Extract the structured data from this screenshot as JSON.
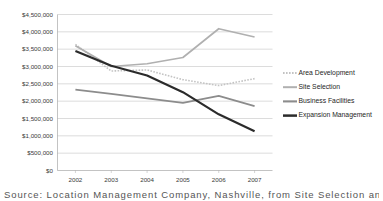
{
  "chart_data": {
    "type": "line",
    "title": "",
    "xlabel": "",
    "ylabel": "",
    "categories": [
      "2002",
      "2003",
      "2004",
      "2005",
      "2006",
      "2007"
    ],
    "ylim": [
      0,
      4500000
    ],
    "ytick_values": [
      0,
      500000,
      1000000,
      1500000,
      2000000,
      2500000,
      3000000,
      3500000,
      4000000,
      4500000
    ],
    "ytick_labels": [
      "$0",
      "$500,000",
      "$1,000,000",
      "$1,500,000",
      "$2,000,000",
      "$2,500,000",
      "$3,000,000",
      "$3,500,000",
      "$4,000,000",
      "$4,500,000"
    ],
    "grid": true,
    "legend_position": "right",
    "series": [
      {
        "name": "Area Development",
        "color": "#c3c3c3",
        "style": "dotted",
        "width": 1.6,
        "values": [
          3640000,
          2870000,
          2900000,
          2620000,
          2450000,
          2650000
        ]
      },
      {
        "name": "Site Selection",
        "color": "#b0b0b0",
        "style": "solid",
        "width": 1.7,
        "values": [
          3600000,
          3000000,
          3080000,
          3260000,
          4090000,
          3850000
        ]
      },
      {
        "name": "Business Facilities",
        "color": "#8c8c8c",
        "style": "solid",
        "width": 1.8,
        "values": [
          2330000,
          2210000,
          2080000,
          1950000,
          2150000,
          1860000
        ]
      },
      {
        "name": "Expansion Management",
        "color": "#2b2b2b",
        "style": "solid",
        "width": 2.2,
        "values": [
          3450000,
          3020000,
          2740000,
          2260000,
          1620000,
          1130000
        ]
      }
    ]
  },
  "caption": {
    "text": "Source: Location Management Company, Nashville, from Site Selection and Business"
  }
}
